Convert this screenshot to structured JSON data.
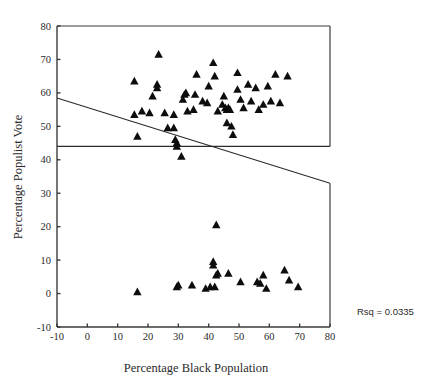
{
  "chart_data": {
    "type": "scatter",
    "title": "",
    "xlabel": "Percentage Black Population",
    "ylabel": "Percentage Populist Vote",
    "xlim": [
      -10,
      80
    ],
    "ylim": [
      -10,
      80
    ],
    "xticks": [
      -10,
      0,
      10,
      20,
      30,
      40,
      50,
      60,
      70,
      80
    ],
    "yticks": [
      -10,
      0,
      10,
      20,
      30,
      40,
      50,
      60,
      70,
      80
    ],
    "xtick_labels": [
      "-10",
      "0",
      "10",
      "20",
      "30",
      "40",
      "50",
      "60",
      "70",
      "80"
    ],
    "ytick_labels": [
      "-10",
      "0",
      "10",
      "20",
      "30",
      "40",
      "50",
      "60",
      "70",
      "80"
    ],
    "grid": false,
    "legend": null,
    "marker": "triangle",
    "marker_color": "#0d0d0d",
    "annotations": [
      {
        "name": "rsq",
        "text": "Rsq = 0.0335",
        "x": 87,
        "y": 0
      }
    ],
    "reference_line": {
      "name": "horizontal-mean-line",
      "orientation": "horizontal",
      "y": 44.0,
      "x_start": -10,
      "x_end": 80
    },
    "fit_line": {
      "name": "regression-line",
      "x_start": -10,
      "y_start": 58.5,
      "x_end": 80,
      "y_end": 33.0,
      "slope": -0.2833,
      "intercept": 55.67
    },
    "points": [
      [
        16.5,
        47.0
      ],
      [
        15.5,
        53.5
      ],
      [
        15.5,
        63.5
      ],
      [
        18.0,
        54.5
      ],
      [
        20.5,
        54.0
      ],
      [
        21.5,
        59.0
      ],
      [
        23.0,
        62.5
      ],
      [
        23.0,
        61.5
      ],
      [
        23.5,
        71.5
      ],
      [
        25.5,
        54.0
      ],
      [
        28.5,
        53.5
      ],
      [
        26.5,
        49.5
      ],
      [
        28.5,
        49.5
      ],
      [
        29.0,
        46.0
      ],
      [
        29.5,
        45.0
      ],
      [
        29.5,
        44.0
      ],
      [
        31.0,
        41.0
      ],
      [
        31.5,
        58.0
      ],
      [
        32.0,
        59.5
      ],
      [
        32.5,
        60.0
      ],
      [
        33.0,
        54.5
      ],
      [
        35.0,
        55.0
      ],
      [
        35.5,
        59.5
      ],
      [
        36.0,
        65.5
      ],
      [
        38.0,
        57.5
      ],
      [
        39.5,
        57.0
      ],
      [
        40.0,
        62.0
      ],
      [
        41.5,
        69.0
      ],
      [
        42.0,
        65.0
      ],
      [
        43.0,
        54.5
      ],
      [
        44.5,
        56.5
      ],
      [
        45.0,
        59.0
      ],
      [
        45.5,
        55.5
      ],
      [
        46.0,
        55.0
      ],
      [
        46.5,
        55.5
      ],
      [
        47.0,
        55.0
      ],
      [
        46.0,
        51.0
      ],
      [
        47.5,
        50.0
      ],
      [
        48.0,
        47.5
      ],
      [
        49.5,
        61.0
      ],
      [
        49.5,
        66.0
      ],
      [
        50.5,
        58.0
      ],
      [
        51.5,
        55.5
      ],
      [
        53.0,
        62.5
      ],
      [
        54.0,
        57.5
      ],
      [
        55.5,
        61.5
      ],
      [
        56.5,
        55.0
      ],
      [
        58.0,
        56.5
      ],
      [
        59.5,
        62.0
      ],
      [
        60.5,
        57.5
      ],
      [
        62.0,
        65.5
      ],
      [
        63.5,
        57.0
      ],
      [
        66.0,
        65.0
      ],
      [
        16.5,
        0.5
      ],
      [
        29.5,
        2.0
      ],
      [
        30.0,
        2.5
      ],
      [
        34.5,
        2.5
      ],
      [
        39.0,
        1.5
      ],
      [
        41.5,
        8.5
      ],
      [
        41.5,
        9.5
      ],
      [
        42.5,
        20.5
      ],
      [
        40.5,
        2.0
      ],
      [
        42.0,
        2.0
      ],
      [
        42.5,
        5.5
      ],
      [
        43.0,
        6.0
      ],
      [
        46.5,
        6.0
      ],
      [
        50.5,
        3.5
      ],
      [
        56.0,
        3.5
      ],
      [
        57.0,
        3.0
      ],
      [
        58.0,
        5.5
      ],
      [
        59.0,
        1.5
      ],
      [
        65.0,
        7.0
      ],
      [
        66.5,
        4.0
      ],
      [
        69.5,
        2.0
      ]
    ]
  }
}
